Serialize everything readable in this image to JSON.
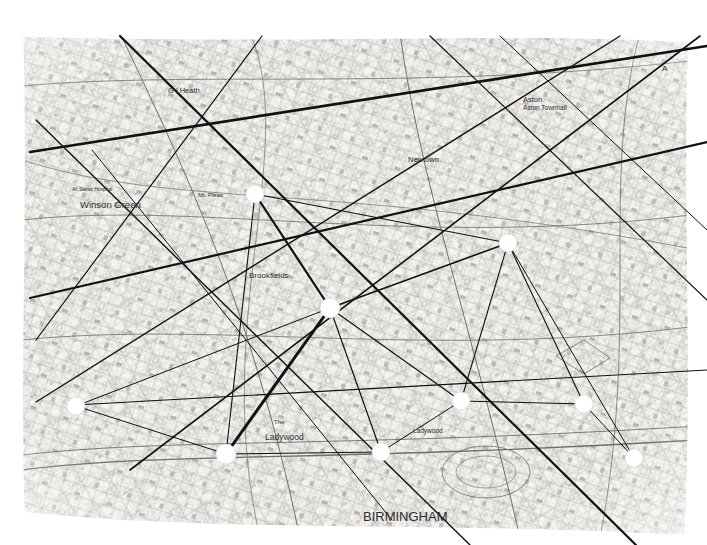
{
  "document": {
    "title": "Birmingham street map with overlaid network graph",
    "background_color": "#ffffff",
    "paper_tint": "#f4f3ef",
    "ink_color": "#5a5a58",
    "overlay_line_color": "#111111",
    "node_color": "#ffffff",
    "width": 707,
    "height": 545
  },
  "map": {
    "city_label": "BIRMINGHAM",
    "labels": [
      {
        "text": "G l  Heath",
        "x": 168,
        "y": 86,
        "size": 7.5,
        "weight": "400",
        "italic": false
      },
      {
        "text": "Aston",
        "x": 523,
        "y": 95,
        "size": 7.5,
        "weight": "400",
        "italic": false
      },
      {
        "text": "Aston Townhall",
        "x": 523,
        "y": 104,
        "size": 6.5,
        "weight": "400",
        "italic": false
      },
      {
        "text": "Newtown",
        "x": 408,
        "y": 155,
        "size": 7.5,
        "weight": "400",
        "italic": false
      },
      {
        "text": "Winson Green",
        "x": 80,
        "y": 199,
        "size": 9.5,
        "weight": "400",
        "italic": false
      },
      {
        "text": "All Saints Hospital",
        "x": 72,
        "y": 186,
        "size": 5,
        "weight": "400",
        "italic": false
      },
      {
        "text": "Mt. Pleas",
        "x": 198,
        "y": 192,
        "size": 6,
        "weight": "400",
        "italic": false
      },
      {
        "text": "Brookfields",
        "x": 249,
        "y": 271,
        "size": 8,
        "weight": "400",
        "italic": false
      },
      {
        "text": "Ladywood",
        "x": 265,
        "y": 432,
        "size": 8.5,
        "weight": "400",
        "italic": false
      },
      {
        "text": "The",
        "x": 274,
        "y": 419,
        "size": 6,
        "weight": "400",
        "italic": false
      },
      {
        "text": "Ladywood",
        "x": 413,
        "y": 427,
        "size": 6.5,
        "weight": "400",
        "italic": false
      },
      {
        "text": "A",
        "x": 662,
        "y": 64,
        "size": 8,
        "weight": "400",
        "italic": false
      },
      {
        "text": "BIRMINGHAM",
        "x": 363,
        "y": 509,
        "size": 13,
        "weight": "400",
        "italic": false
      }
    ]
  },
  "graph": {
    "node_radius": 9,
    "nodes": [
      {
        "id": "n1",
        "x": 255,
        "y": 194,
        "r": 9
      },
      {
        "id": "n2",
        "x": 508,
        "y": 243,
        "r": 9
      },
      {
        "id": "n3",
        "x": 330,
        "y": 308,
        "r": 10
      },
      {
        "id": "n4",
        "x": 76,
        "y": 406,
        "r": 9
      },
      {
        "id": "n5",
        "x": 461,
        "y": 401,
        "r": 9
      },
      {
        "id": "n6",
        "x": 584,
        "y": 404,
        "r": 9
      },
      {
        "id": "n7",
        "x": 226,
        "y": 454,
        "r": 10
      },
      {
        "id": "n8",
        "x": 381,
        "y": 452,
        "r": 9
      },
      {
        "id": "n9",
        "x": 634,
        "y": 458,
        "r": 9
      }
    ],
    "edges": [
      {
        "from": [
          255,
          194
        ],
        "to": [
          330,
          308
        ],
        "width": 2.2
      },
      {
        "from": [
          255,
          194
        ],
        "to": [
          508,
          243
        ],
        "width": 1.1
      },
      {
        "from": [
          255,
          194
        ],
        "to": [
          226,
          454
        ],
        "width": 1.1
      },
      {
        "from": [
          330,
          308
        ],
        "to": [
          508,
          243
        ],
        "width": 1.6
      },
      {
        "from": [
          330,
          308
        ],
        "to": [
          226,
          454
        ],
        "width": 3.0
      },
      {
        "from": [
          330,
          308
        ],
        "to": [
          381,
          452
        ],
        "width": 1.2
      },
      {
        "from": [
          330,
          308
        ],
        "to": [
          461,
          401
        ],
        "width": 1.2
      },
      {
        "from": [
          330,
          308
        ],
        "to": [
          76,
          406
        ],
        "width": 1.0
      },
      {
        "from": [
          508,
          243
        ],
        "to": [
          461,
          401
        ],
        "width": 1.1
      },
      {
        "from": [
          508,
          243
        ],
        "to": [
          584,
          404
        ],
        "width": 1.1
      },
      {
        "from": [
          508,
          243
        ],
        "to": [
          634,
          458
        ],
        "width": 1.0
      },
      {
        "from": [
          461,
          401
        ],
        "to": [
          381,
          452
        ],
        "width": 1.0
      },
      {
        "from": [
          461,
          401
        ],
        "to": [
          584,
          404
        ],
        "width": 1.0
      },
      {
        "from": [
          584,
          404
        ],
        "to": [
          634,
          458
        ],
        "width": 1.0
      },
      {
        "from": [
          226,
          454
        ],
        "to": [
          381,
          452
        ],
        "width": 1.0
      },
      {
        "from": [
          76,
          406
        ],
        "to": [
          226,
          454
        ],
        "width": 1.0
      }
    ],
    "long_lines": [
      {
        "from": [
          30,
          152
        ],
        "to": [
          707,
          46
        ],
        "width": 2.6
      },
      {
        "from": [
          30,
          298
        ],
        "to": [
          707,
          142
        ],
        "width": 2.2
      },
      {
        "from": [
          120,
          36
        ],
        "to": [
          636,
          545
        ],
        "width": 2.2
      },
      {
        "from": [
          700,
          36
        ],
        "to": [
          130,
          470
        ],
        "width": 1.6
      },
      {
        "from": [
          36,
          120
        ],
        "to": [
          470,
          545
        ],
        "width": 1.4
      },
      {
        "from": [
          36,
          402
        ],
        "to": [
          620,
          36
        ],
        "width": 1.4
      },
      {
        "from": [
          262,
          36
        ],
        "to": [
          36,
          340
        ],
        "width": 1.2
      },
      {
        "from": [
          430,
          36
        ],
        "to": [
          707,
          300
        ],
        "width": 1.2
      },
      {
        "from": [
          75,
          405
        ],
        "to": [
          707,
          370
        ],
        "width": 1.2
      },
      {
        "from": [
          92,
          150
        ],
        "to": [
          392,
          520
        ],
        "width": 1.0
      },
      {
        "from": [
          500,
          36
        ],
        "to": [
          707,
          230
        ],
        "width": 1.0
      }
    ]
  }
}
